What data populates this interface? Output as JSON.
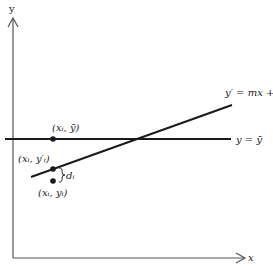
{
  "diagram": {
    "axes": {
      "x_label": "x",
      "y_label": "y"
    },
    "lines": {
      "mean_line_label": "y = ȳ",
      "regression_line_label": "y′ = mx + b"
    },
    "points": {
      "mean_point_label": "(xᵢ, ȳ)",
      "fitted_point_label": "(xᵢ, y′ᵢ)",
      "observed_point_label": "(xᵢ, yᵢ)"
    },
    "deviation_label": "dᵢ",
    "colors": {
      "stroke": "#1a1a1a",
      "axis": "#555555",
      "background": "#ffffff"
    }
  }
}
